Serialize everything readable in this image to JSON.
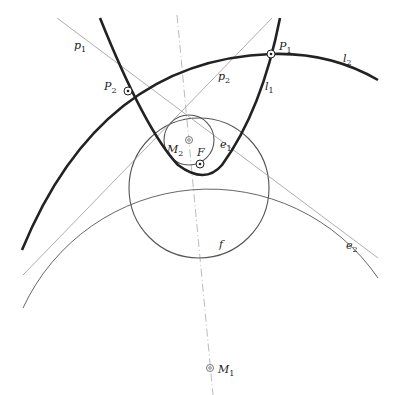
{
  "diagram": {
    "title": "",
    "colors": {
      "thick": "#222222",
      "thin": "#555555",
      "line": "#999999",
      "axis": "#aaaaaa",
      "background": "#ffffff"
    },
    "labels": {
      "p1": {
        "base": "p",
        "sub": "1"
      },
      "p2": {
        "base": "p",
        "sub": "2"
      },
      "P1": {
        "base": "P",
        "sub": "1"
      },
      "P2": {
        "base": "P",
        "sub": "2"
      },
      "l1": {
        "base": "l",
        "sub": "1"
      },
      "l2": {
        "base": "l",
        "sub": "2"
      },
      "e1": {
        "base": "e",
        "sub": "1"
      },
      "e2": {
        "base": "e",
        "sub": "2"
      },
      "M1": {
        "base": "M",
        "sub": "1"
      },
      "M2": {
        "base": "M",
        "sub": "2"
      },
      "F": {
        "base": "F",
        "sub": ""
      },
      "f": {
        "base": "f",
        "sub": ""
      }
    },
    "points": [
      {
        "name": "P1",
        "x": 271,
        "y": 54
      },
      {
        "name": "P2",
        "x": 128,
        "y": 91
      },
      {
        "name": "F",
        "x": 200,
        "y": 164
      },
      {
        "name": "M2",
        "x": 189,
        "y": 140
      },
      {
        "name": "M1",
        "x": 210,
        "y": 368
      }
    ]
  }
}
